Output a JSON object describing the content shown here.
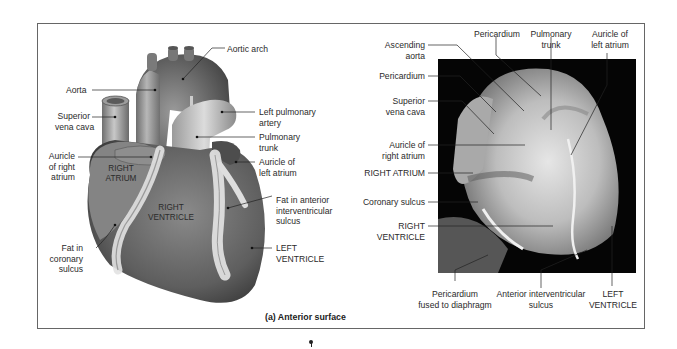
{
  "figure": {
    "caption": "(a) Anterior surface",
    "panel_left": {
      "type": "illustration",
      "labels": {
        "aortic_arch": "Aortic arch",
        "aorta": "Aorta",
        "superior_vena_cava_1": "Superior",
        "superior_vena_cava_2": "vena cava",
        "left_pulmonary_artery_1": "Left pulmonary",
        "left_pulmonary_artery_2": "artery",
        "pulmonary_trunk_1": "Pulmonary",
        "pulmonary_trunk_2": "trunk",
        "auricle_right_atrium_1": "Auricle",
        "auricle_right_atrium_2": "of right",
        "auricle_right_atrium_3": "atrium",
        "auricle_left_atrium_1": "Auricle of",
        "auricle_left_atrium_2": "left atrium",
        "fat_anterior_1": "Fat in anterior",
        "fat_anterior_2": "interventricular",
        "fat_anterior_3": "sulcus",
        "fat_coronary_1": "Fat in",
        "fat_coronary_2": "coronary",
        "fat_coronary_3": "sulcus",
        "left_ventricle_1": "LEFT",
        "left_ventricle_2": "VENTRICLE"
      },
      "region_labels": {
        "right_atrium_1": "RIGHT",
        "right_atrium_2": "ATRIUM",
        "right_ventricle_1": "RIGHT",
        "right_ventricle_2": "VENTRICLE"
      }
    },
    "panel_right": {
      "type": "photograph",
      "labels": {
        "ascending_aorta_1": "Ascending",
        "ascending_aorta_2": "aorta",
        "pericardium_top": "Pericardium",
        "pulmonary_trunk_1": "Pulmonary",
        "pulmonary_trunk_2": "trunk",
        "auricle_left_atrium_1": "Auricle of",
        "auricle_left_atrium_2": "left atrium",
        "pericardium_left": "Pericardium",
        "superior_vena_cava_1": "Superior",
        "superior_vena_cava_2": "vena cava",
        "auricle_right_atrium_1": "Auricle of",
        "auricle_right_atrium_2": "right atrium",
        "right_atrium": "RIGHT ATRIUM",
        "coronary_sulcus": "Coronary sulcus",
        "right_ventricle_1": "RIGHT",
        "right_ventricle_2": "VENTRICLE",
        "pericardium_diaphragm_1": "Pericardium",
        "pericardium_diaphragm_2": "fused to diaphragm",
        "anterior_sulcus_1": "Anterior interventricular",
        "anterior_sulcus_2": "sulcus",
        "left_ventricle_1": "LEFT",
        "left_ventricle_2": "VENTRICLE"
      }
    }
  }
}
